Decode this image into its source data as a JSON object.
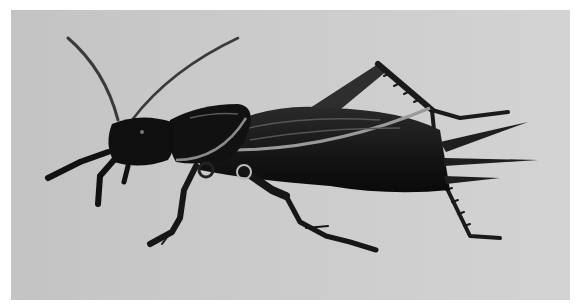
{
  "image": {
    "subject": "cricket illustration",
    "description": "Black-and-white drawing of a cricket in side profile on a light gray background",
    "colors": {
      "page_background": "#ffffff",
      "panel_background": "#cbcbcb",
      "insect_dark": "#141414",
      "insect_mid": "#3a3a3a",
      "highlight": "#9a9a9a"
    }
  }
}
